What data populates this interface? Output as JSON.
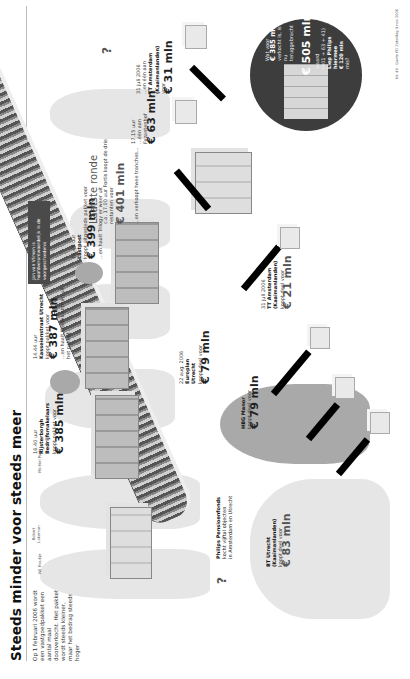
{
  "header": {
    "title": "Steeds minder voor steeds meer",
    "intro": "Op 1 februari 2006 wordt een vastgoedpakket een aantal maal doorverkocht. Het pakket wordt steeds kleiner, maar het bedrag steeds hoger"
  },
  "people": [
    {
      "name": "Wil Froukje"
    },
    {
      "name": "Robert Lakeman"
    },
    {
      "name": "Michiel Paris"
    },
    {
      "name": "Jan van Vlimen"
    },
    {
      "name": "Jan van Vlimen"
    },
    {
      "name": "Ruud Smeets"
    },
    {
      "name": "Bert Hakkesteegt"
    },
    {
      "name": "Bas Quandt"
    },
    {
      "name": "John Pieterse uit Nijmegen"
    }
  ],
  "transactions": [
    {
      "lines": [
        "Philips Pensioenfonds",
        "kocht vijftal objecten",
        "in Amsterdam en Utrecht"
      ]
    },
    {
      "time": "16.40 uur",
      "buyer": "Rijsterborgh Bedrijfsmakelaars",
      "action": "koopt pakket voor",
      "amount": "€ 385 mln"
    },
    {
      "time": "14.44 uur",
      "buyer": "Kasseienstraat Utrecht",
      "action": "koopt pakket voor",
      "amount": "€ 387 mln",
      "note": "...en haalt Kasseicentrum uit het pakket"
    },
    {
      "time": "16.49 uur",
      "buyer": "Lastpost",
      "action": "koopt uitgeslede pakket voor",
      "amount": "€ 399 mln",
      "note": "...en haalt Trilogy er weer uit"
    }
  ],
  "callout": {
    "text": "Jan van Vlimen is hoofdverantwoordelijk in de voorgeschiedenis"
  },
  "last_round": {
    "heading": "Laatste ronde",
    "text": "c.a. 17.00 uur Fortis koopt de drie restanten voor",
    "amount": "€ 401 mln",
    "note": "...en verkoopt twee tranches...",
    "sale1": {
      "time": "17.15 uur",
      "text": "...één aan Fazantenhof",
      "amount": "€ 63 mln"
    },
    "sale2": {
      "date": "31 juli 2006",
      "text": "...en één aan",
      "buyer": "TT Amsterdam (Kaaimanlanden)",
      "suffix": "voor",
      "amount": "€ 31 mln"
    }
  },
  "partials": [
    {
      "date": "22 aug. 2006",
      "buyer": "Europlan Utrecht",
      "action": "koopt deel voor",
      "amount": "€ 79 mln"
    },
    {
      "date": "31 juli 2006",
      "buyer": "TT Amsterdam (Kaaimanlanden)",
      "action": "koopt deel voor",
      "amount": "€ 21 mln"
    },
    {
      "buyer": "HBG Manor",
      "action": "koopt deel voor",
      "amount": "€ 79 mln"
    },
    {
      "buyer": "BT Utrecht (Kaaimanlanden)",
      "action": "koopt deel voor",
      "amount": "€ 83 mln"
    }
  ],
  "summary_circle": {
    "line1": "Wat voor",
    "amount1": "€ 385 mln",
    "line2": "verkocht is, is nu teruggebracht",
    "amount2": "€ 505 mln",
    "line3": "waard",
    "calc": "(401 + 63 + 41)",
    "line4": "Liep Philips hiermee",
    "amount3": "€ 120 mln",
    "line5": "mis?"
  },
  "question_marks": [
    "?",
    "?"
  ],
  "footer": {
    "text": "Nr. 44 · Quote FD Zaterdag 4 nov 2006"
  }
}
